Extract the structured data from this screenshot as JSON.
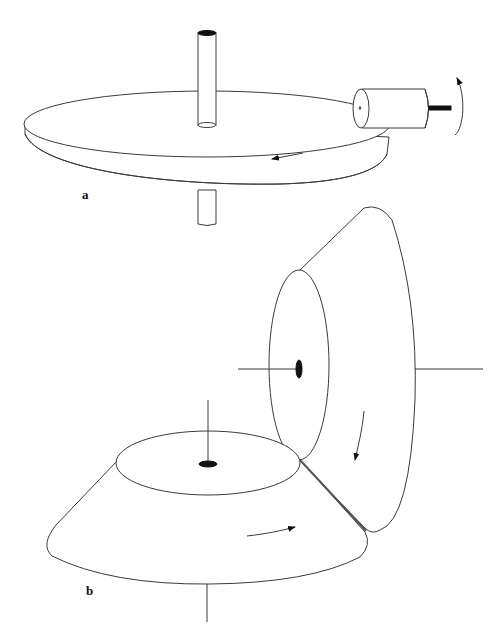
{
  "figure": {
    "header_fragment": "",
    "panels": [
      {
        "label": "a",
        "description": "Horizontal disk on vertical shaft driven by a small roller wheel at its rim",
        "parts": [
          "vertical-shaft",
          "disk",
          "drive-roller",
          "roller-shaft",
          "rotation-arrow-roller",
          "rotation-arrow-disk"
        ]
      },
      {
        "label": "b",
        "description": "Two conical frustums in rolling contact along a common line, each with its own axis",
        "parts": [
          "horizontal-cone",
          "vertical-cone",
          "contact-line",
          "rotation-arrow-horizontal-cone",
          "rotation-arrow-vertical-cone"
        ]
      }
    ]
  }
}
